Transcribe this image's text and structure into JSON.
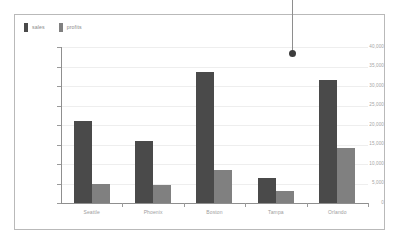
{
  "legend": {
    "position": "top-left",
    "items": [
      {
        "label": "sales",
        "color": "#4a4a4a",
        "icon": "legend-swatch-icon"
      },
      {
        "label": "profits",
        "color": "#808080",
        "icon": "legend-swatch-icon"
      }
    ]
  },
  "annotation": {
    "marker": "callout-dot",
    "line_color": "#8e8e8e",
    "dot_color": "#3c3c3c"
  },
  "chart_data": {
    "type": "bar",
    "title": "",
    "subtitle": "",
    "xlabel": "",
    "ylabel": "",
    "categories": [
      "Seattle",
      "Phoenix",
      "Boston",
      "Tampa",
      "Orlando"
    ],
    "series": [
      {
        "name": "sales",
        "color": "#4a4a4a",
        "values": [
          21000,
          16000,
          33500,
          6500,
          31500
        ]
      },
      {
        "name": "profits",
        "color": "#808080",
        "values": [
          5000,
          4500,
          8500,
          3000,
          14000
        ]
      }
    ],
    "ylim": [
      0,
      40000
    ],
    "ytick_values": [
      0,
      5000,
      10000,
      15000,
      20000,
      25000,
      30000,
      35000,
      40000
    ],
    "ytick_labels": [
      "0",
      "5,000",
      "10,000",
      "15,000",
      "20,000",
      "25,000",
      "30,000",
      "35,000",
      "40,000"
    ],
    "grid": true,
    "grid_axis": "y",
    "legend_position": "top-left",
    "orientation": "vertical",
    "bar_gap": 0
  }
}
